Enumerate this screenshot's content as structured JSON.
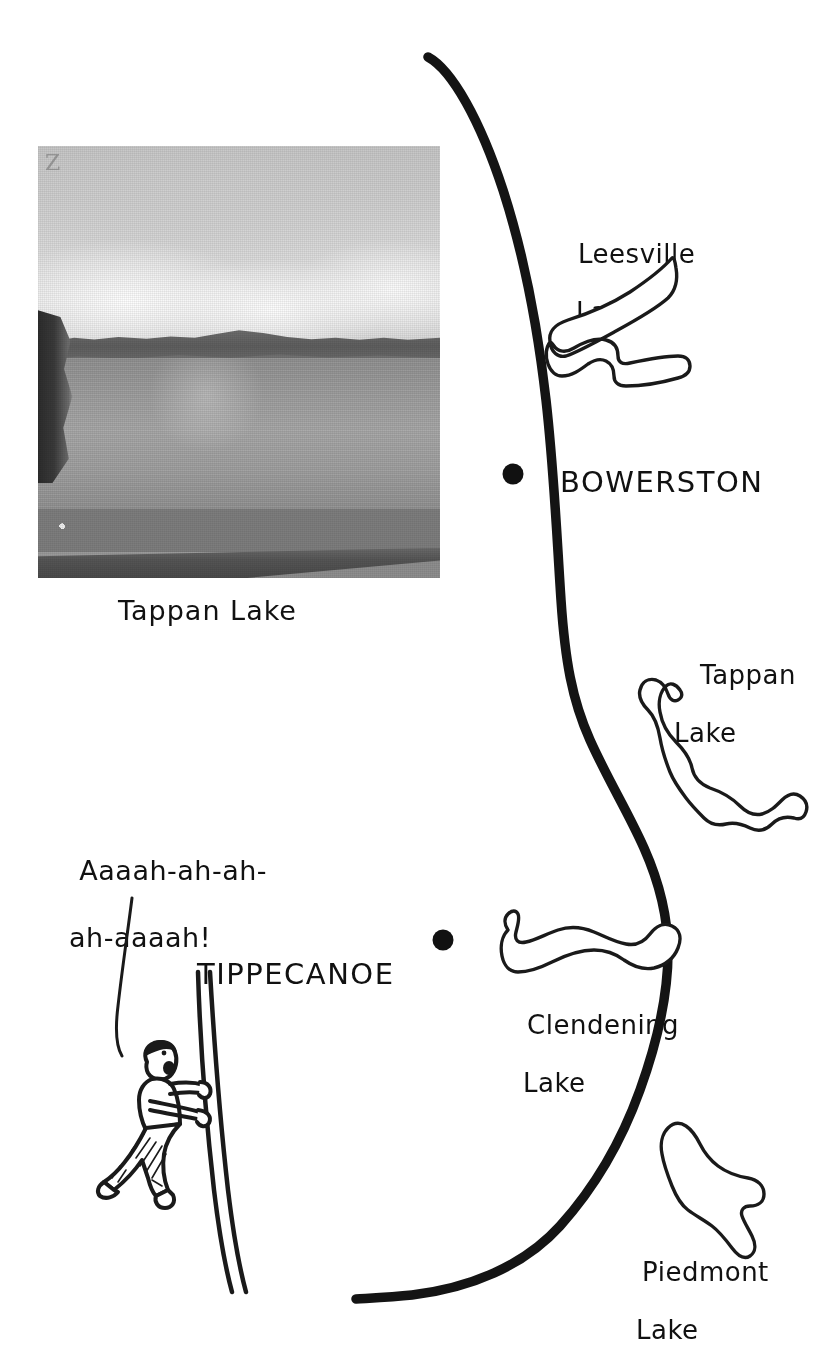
{
  "map": {
    "title_caption": "Tappan Lake",
    "photo": {
      "watermark": "Z",
      "caption": "Tappan Lake",
      "alt_name": "tappan-lake-photo"
    },
    "road": {
      "name": "main-road-line",
      "color": "#111111"
    },
    "towns": [
      {
        "name": "BOWERSTON",
        "dot_x": 513,
        "dot_y": 474
      },
      {
        "name": "TIPPECANOE",
        "dot_x": 443,
        "dot_y": 940
      }
    ],
    "lakes": [
      {
        "line1": "Leesville",
        "line2": "Lake"
      },
      {
        "line1": "Tappan",
        "line2": "Lake"
      },
      {
        "line1": "Clendening",
        "line2": "Lake"
      },
      {
        "line1": "Piedmont",
        "line2": "Lake"
      }
    ],
    "cartoon": {
      "scream_line1": "Aaaah-ah-ah-",
      "scream_line2": "ah-aaaah!",
      "figure_name": "climbing-person-figure"
    },
    "colors": {
      "ink": "#111111",
      "paper": "#ffffff"
    }
  }
}
